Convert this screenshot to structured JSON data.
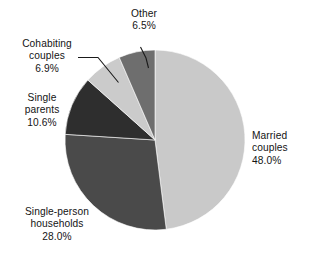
{
  "chart_data": {
    "type": "pie",
    "title": "",
    "subtitle": "",
    "xlabel": "",
    "ylabel": "",
    "legend_position": "none",
    "grid": false,
    "units": "percent",
    "start_angle_deg": 0,
    "direction": "clockwise",
    "categories": [
      "Married couples",
      "Single-person households",
      "Single parents",
      "Cohabiting couples",
      "Other"
    ],
    "values": [
      48.0,
      28.0,
      10.6,
      6.9,
      6.5
    ],
    "value_labels": [
      "48.0%",
      "28.0%",
      "10.6%",
      "6.9%",
      "6.5%"
    ],
    "colors": [
      "#c9c9c9",
      "#4a4a4a",
      "#2e2e2e",
      "#cbcbcb",
      "#6e6e6e"
    ],
    "slices": [
      {
        "name": "married-couples",
        "label_lines": [
          "Married",
          "couples"
        ],
        "value": 48.0,
        "value_label": "48.0%",
        "color": "#c9c9c9",
        "start_deg": 0.0,
        "end_deg": 172.8,
        "label_placement": "outside-right",
        "leader_line": false
      },
      {
        "name": "single-person-households",
        "label_lines": [
          "Single-person",
          "households"
        ],
        "value": 28.0,
        "value_label": "28.0%",
        "color": "#4a4a4a",
        "start_deg": 172.8,
        "end_deg": 273.6,
        "label_placement": "outside-bottom-left",
        "leader_line": false
      },
      {
        "name": "single-parents",
        "label_lines": [
          "Single",
          "parents"
        ],
        "value": 10.6,
        "value_label": "10.6%",
        "color": "#2e2e2e",
        "start_deg": 273.6,
        "end_deg": 311.76,
        "label_placement": "outside-left",
        "leader_line": false
      },
      {
        "name": "cohabiting-couples",
        "label_lines": [
          "Cohabiting",
          "couples"
        ],
        "value": 6.9,
        "value_label": "6.9%",
        "color": "#cbcbcb",
        "start_deg": 311.76,
        "end_deg": 336.6,
        "label_placement": "outside-upper-left",
        "leader_line": true
      },
      {
        "name": "other",
        "label_lines": [
          "Other"
        ],
        "value": 6.5,
        "value_label": "6.5%",
        "color": "#6e6e6e",
        "start_deg": 336.6,
        "end_deg": 360.0,
        "label_placement": "outside-top",
        "leader_line": true
      }
    ]
  },
  "labels": {
    "married": {
      "line1": "Married",
      "line2": "couples",
      "pct": "48.0%"
    },
    "single_person": {
      "line1": "Single-person",
      "line2": "households",
      "pct": "28.0%"
    },
    "single_parents": {
      "line1": "Single",
      "line2": "parents",
      "pct": "10.6%"
    },
    "cohabiting": {
      "line1": "Cohabiting",
      "line2": "couples",
      "pct": "6.9%"
    },
    "other": {
      "line1": "Other",
      "pct": "6.5%"
    }
  },
  "geometry": {
    "center_x": 155,
    "center_y": 140,
    "radius": 90
  }
}
